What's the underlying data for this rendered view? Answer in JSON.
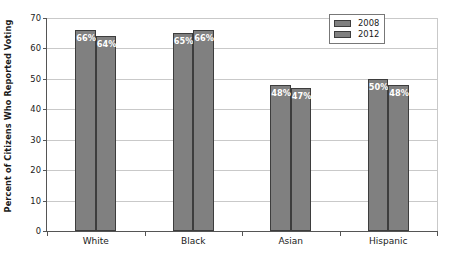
{
  "chart_data": {
    "type": "bar",
    "title": "",
    "subtitle": "",
    "xlabel": "",
    "ylabel": "Percent of Citizens Who Reported Voting",
    "categories": [
      "White",
      "Black",
      "Asian",
      "Hispanic"
    ],
    "series": [
      {
        "name": "2008",
        "values": [
          66,
          65,
          48,
          50
        ],
        "color": "#808080"
      },
      {
        "name": "2012",
        "values": [
          64,
          66,
          47,
          48
        ],
        "color": "#808080"
      }
    ],
    "data_labels": [
      [
        "66%",
        "64%"
      ],
      [
        "65%",
        "66%"
      ],
      [
        "48%",
        "47%"
      ],
      [
        "50%",
        "48%"
      ]
    ],
    "ylim": [
      0,
      70
    ],
    "ytick_values": [
      70,
      60,
      50,
      40,
      30,
      20,
      10,
      0
    ],
    "ytick_labels": [
      "70",
      "60",
      "50",
      "40",
      "30",
      "20",
      "10",
      "0"
    ],
    "grid": "horizontal",
    "legend_position": "top-right",
    "legend_entries": [
      "2008",
      "2012"
    ],
    "background_color": "#ffffff",
    "bar_border_color": "#3d3d3d",
    "gridline_color": "#c9c9c9",
    "axis_color": "#555555",
    "label_text_color": "#ffffff"
  }
}
